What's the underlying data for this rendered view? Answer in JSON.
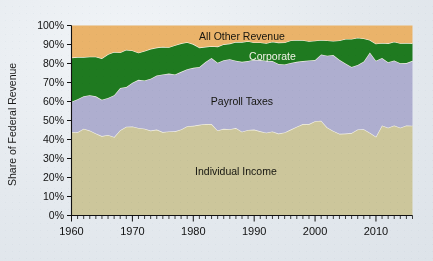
{
  "chart_data": {
    "type": "area",
    "stacked": true,
    "title": "",
    "xlabel": "",
    "ylabel": "Share of Federal Revenue",
    "xlim": [
      1960,
      2016
    ],
    "ylim": [
      0,
      100
    ],
    "grid": false,
    "legend_position": "inline-annotations",
    "ytick_labels": [
      "0%",
      "10%",
      "20%",
      "30%",
      "40%",
      "50%",
      "60%",
      "70%",
      "80%",
      "90%",
      "100%"
    ],
    "ytick_values": [
      0,
      10,
      20,
      30,
      40,
      50,
      60,
      70,
      80,
      90,
      100
    ],
    "xtick_labels": [
      "1960",
      "1970",
      "1980",
      "1990",
      "2000",
      "2010"
    ],
    "xtick_values": [
      1960,
      1970,
      1980,
      1990,
      2000,
      2010
    ],
    "minor_tick_interval": 1,
    "colors": {
      "individual_income": "#ccc69b",
      "payroll_taxes": "#aeaecf",
      "corporate": "#1f7a20",
      "all_other_revenue": "#eab36a",
      "edge": "#f4f2e6",
      "axis": "#111111",
      "background": "#e6ebf0"
    },
    "annotations": [
      {
        "text": "All Other Revenue",
        "x": 1988,
        "y": 94,
        "color": "#15150f"
      },
      {
        "text": "Corporate",
        "x": 1993,
        "y": 83.5,
        "color": "#f2f2e8"
      },
      {
        "text": "Payroll Taxes",
        "x": 1988,
        "y": 60,
        "color": "#15150f"
      },
      {
        "text": "Individual Income",
        "x": 1987,
        "y": 23,
        "color": "#15150f"
      }
    ],
    "x": [
      1960,
      1961,
      1962,
      1963,
      1964,
      1965,
      1966,
      1967,
      1968,
      1969,
      1970,
      1971,
      1972,
      1973,
      1974,
      1975,
      1976,
      1977,
      1978,
      1979,
      1980,
      1981,
      1982,
      1983,
      1984,
      1985,
      1986,
      1987,
      1988,
      1989,
      1990,
      1991,
      1992,
      1993,
      1994,
      1995,
      1996,
      1997,
      1998,
      1999,
      2000,
      2001,
      2002,
      2003,
      2004,
      2005,
      2006,
      2007,
      2008,
      2009,
      2010,
      2011,
      2012,
      2013,
      2014,
      2015,
      2016
    ],
    "series": [
      {
        "name": "Individual Income",
        "values": [
          44.0,
          43.8,
          45.7,
          44.7,
          43.2,
          41.8,
          42.4,
          41.3,
          44.9,
          46.7,
          46.9,
          46.1,
          45.7,
          44.7,
          45.2,
          43.9,
          44.2,
          44.3,
          45.3,
          47.0,
          47.2,
          47.7,
          48.2,
          48.1,
          44.8,
          45.6,
          45.4,
          46.0,
          44.1,
          45.0,
          45.2,
          44.3,
          43.6,
          44.2,
          43.1,
          43.7,
          45.2,
          46.7,
          48.1,
          48.1,
          49.6,
          49.9,
          46.3,
          44.5,
          43.0,
          43.1,
          43.4,
          45.3,
          45.4,
          43.5,
          41.5,
          47.4,
          46.2,
          47.4,
          46.2,
          47.4,
          47.3
        ]
      },
      {
        "name": "Payroll Taxes",
        "values": [
          15.9,
          17.4,
          17.1,
          18.6,
          19.5,
          19.1,
          19.5,
          22.0,
          22.2,
          20.9,
          23.0,
          25.3,
          25.4,
          27.3,
          28.5,
          30.3,
          30.5,
          29.9,
          30.3,
          30.0,
          30.5,
          30.5,
          32.6,
          34.8,
          35.6,
          36.1,
          36.9,
          35.5,
          36.8,
          36.3,
          36.8,
          37.5,
          37.9,
          37.1,
          36.7,
          35.8,
          35.1,
          34.2,
          33.2,
          33.5,
          32.2,
          34.9,
          37.8,
          40.0,
          39.0,
          36.9,
          34.8,
          33.9,
          35.7,
          42.3,
          40.0,
          35.5,
          34.5,
          34.2,
          33.9,
          32.8,
          34.1
        ]
      },
      {
        "name": "Corporate",
        "values": [
          23.2,
          22.2,
          20.6,
          20.3,
          20.9,
          21.8,
          23.0,
          22.8,
          18.7,
          19.6,
          17.0,
          14.3,
          15.5,
          15.7,
          14.7,
          14.6,
          13.9,
          15.4,
          15.0,
          14.2,
          12.5,
          10.2,
          8.0,
          6.2,
          8.5,
          8.4,
          8.2,
          9.8,
          10.4,
          10.4,
          9.1,
          9.3,
          9.2,
          10.2,
          11.2,
          11.6,
          11.8,
          11.5,
          11.0,
          10.1,
          10.2,
          7.6,
          8.0,
          7.4,
          10.1,
          12.9,
          14.7,
          14.4,
          12.1,
          6.6,
          8.9,
          7.9,
          9.9,
          9.9,
          10.6,
          10.6,
          9.2
        ]
      },
      {
        "name": "All Other Revenue",
        "values": [
          16.9,
          16.6,
          16.6,
          16.4,
          16.4,
          17.3,
          15.1,
          13.9,
          14.2,
          12.8,
          13.1,
          14.3,
          13.4,
          12.3,
          11.6,
          11.2,
          11.4,
          10.4,
          9.4,
          8.8,
          9.8,
          11.6,
          11.2,
          10.9,
          11.1,
          9.9,
          9.5,
          8.7,
          8.7,
          8.3,
          8.9,
          8.9,
          9.3,
          8.5,
          9.0,
          8.9,
          7.9,
          7.6,
          7.7,
          8.3,
          8.0,
          7.6,
          7.9,
          8.1,
          7.9,
          7.1,
          7.1,
          6.4,
          6.8,
          7.6,
          9.6,
          9.2,
          9.4,
          8.5,
          9.3,
          9.2,
          9.4
        ]
      }
    ]
  },
  "axis": {
    "y_title": "Share of Federal Revenue"
  }
}
